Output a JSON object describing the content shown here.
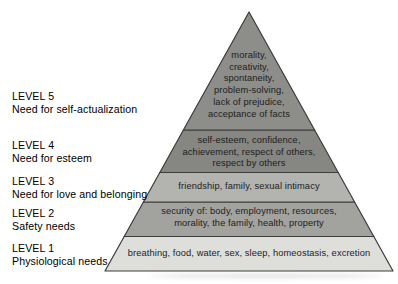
{
  "levels": [
    {
      "level_label": "LEVEL 5",
      "need_label": "Need for self-actualization",
      "band_lines": [
        "morality,",
        "creativity,",
        "spontaneity,",
        "problem-solving,",
        "lack of prejudice,",
        "acceptance of facts"
      ],
      "band_color": "#8d8d8a"
    },
    {
      "level_label": "LEVEL 4",
      "need_label": "Need for esteem",
      "band_lines": [
        "self-esteem, confidence,",
        "achievement, respect of others,",
        "respect by others"
      ],
      "band_color": "#868683"
    },
    {
      "level_label": "LEVEL 3",
      "need_label": "Need for love and belonging",
      "band_lines": [
        "friendship, family, sexual intimacy"
      ],
      "band_color": "#b3b3b0"
    },
    {
      "level_label": "LEVEL 2",
      "need_label": "Safety needs",
      "band_lines": [
        "security of: body, employment, resources,",
        "morality, the family, health, property"
      ],
      "band_color": "#a2a29f"
    },
    {
      "level_label": "LEVEL 1",
      "need_label": "Physiological needs",
      "band_lines": [
        "breathing, food, water, sex, sleep, homeostasis, excretion"
      ],
      "band_color": "#dededb"
    }
  ],
  "colors": {
    "outline": "#3c3c3a",
    "band_text": "#1d1d1b",
    "label_text": "#000000",
    "background": "#ffffff"
  }
}
